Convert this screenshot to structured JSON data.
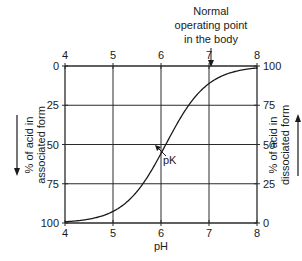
{
  "chart_data": {
    "type": "line",
    "title": "",
    "xlabel": "pH",
    "ylabel_left": "% of acid in associated form",
    "ylabel_right": "% of acid in dissociated form",
    "xlim": [
      4,
      8
    ],
    "ylim": [
      0,
      100
    ],
    "grid": true,
    "x_ticks_top": [
      "4",
      "5",
      "6",
      "7",
      "8"
    ],
    "x_ticks_bottom": [
      "4",
      "5",
      "6",
      "7",
      "8"
    ],
    "y_ticks_left": [
      "0",
      "25",
      "50",
      "75",
      "100"
    ],
    "y_ticks_right": [
      "100",
      "75",
      "50",
      "25",
      "0"
    ],
    "pK": 6.1,
    "series": [
      {
        "name": "% of acid in dissociated form",
        "x": [
          4.0,
          4.5,
          5.0,
          5.5,
          5.8,
          6.0,
          6.1,
          6.2,
          6.4,
          6.7,
          7.0,
          7.4,
          7.7,
          8.0
        ],
        "values": [
          0.8,
          2.5,
          7.4,
          20.1,
          33.4,
          44.3,
          50.0,
          55.7,
          66.6,
          79.9,
          88.8,
          95.2,
          97.5,
          98.8
        ]
      }
    ],
    "annotations": [
      {
        "text": "pK",
        "x": 6.1,
        "y": 50
      },
      {
        "text": "Normal operating point in the body",
        "lines": [
          "Normal",
          "operating point",
          "in the body"
        ],
        "x": 7.4
      }
    ]
  },
  "labels": {
    "xlabel": "pH",
    "pk": "pK",
    "normal_line1": "Normal",
    "normal_line2": "operating point",
    "normal_line3": "in the body",
    "left_line1": "% of acid in",
    "left_line2": "associated form",
    "right_line1": "% of acid in",
    "right_line2": "dissociated form"
  },
  "colors": {
    "line": "#1a1a1a",
    "grid": "#2a2a2a",
    "background": "#ffffff"
  }
}
